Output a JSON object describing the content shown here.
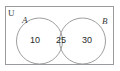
{
  "diagram": {
    "type": "venn-two-set",
    "universe_label": "U",
    "sets": [
      {
        "id": "A",
        "label": "A",
        "label_position": "top-left"
      },
      {
        "id": "B",
        "label": "B",
        "label_position": "top-right"
      }
    ],
    "regions": [
      {
        "id": "A-only",
        "label": "10",
        "value": 10
      },
      {
        "id": "A-and-B",
        "label": "25",
        "value": 25
      },
      {
        "id": "B-only",
        "label": "30",
        "value": 30
      }
    ],
    "colors": {
      "background": "#ffffff",
      "rect_stroke": "#9a9a9a",
      "circle_stroke": "#9e9e9e",
      "text": "#2b2b2b",
      "label_text": "#3a3a3a"
    }
  }
}
